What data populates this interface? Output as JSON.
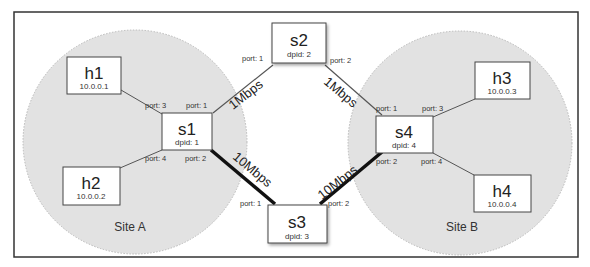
{
  "diagram": {
    "sites": [
      {
        "label": "Site A"
      },
      {
        "label": "Site B"
      }
    ],
    "switches": [
      {
        "name": "s1",
        "dpid": "dpid: 1"
      },
      {
        "name": "s2",
        "dpid": "dpid: 2"
      },
      {
        "name": "s3",
        "dpid": "dpid: 3"
      },
      {
        "name": "s4",
        "dpid": "dpid: 4"
      }
    ],
    "hosts": [
      {
        "name": "h1",
        "ip": "10.0.0.1"
      },
      {
        "name": "h2",
        "ip": "10.0.0.2"
      },
      {
        "name": "h3",
        "ip": "10.0.0.3"
      },
      {
        "name": "h4",
        "ip": "10.0.0.4"
      }
    ],
    "links": [
      {
        "label": "1Mbps",
        "from": "s1",
        "to": "s2"
      },
      {
        "label": "1Mbps",
        "from": "s2",
        "to": "s4"
      },
      {
        "label": "10Mbps",
        "from": "s1",
        "to": "s3"
      },
      {
        "label": "10Mbps",
        "from": "s3",
        "to": "s4"
      }
    ],
    "ports": {
      "s1_h1": "port: 3",
      "s1_s2": "port: 1",
      "s1_h2": "port: 4",
      "s1_s3": "port: 2",
      "s2_s1": "port: 1",
      "s2_s4": "port: 2",
      "s3_s1": "port: 1",
      "s3_s4": "port: 2",
      "s4_s2": "port: 1",
      "s4_h3": "port: 3",
      "s4_s3": "port: 2",
      "s4_h4": "port: 4"
    },
    "colors": {
      "site_fill": "#e2e2e2",
      "site_border": "#b8b8b8",
      "thin_link": "#555555",
      "thick_link": "#111111",
      "frame": "#333333"
    }
  }
}
